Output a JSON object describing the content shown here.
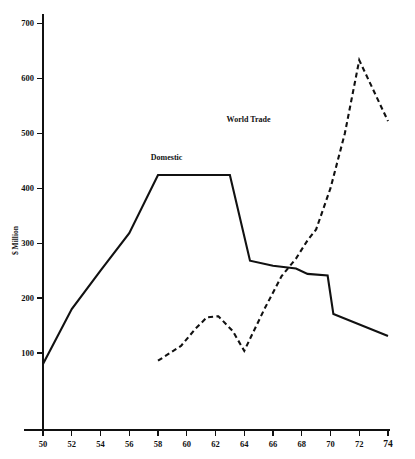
{
  "chart_data": {
    "type": "line",
    "title": "",
    "subtitle": "",
    "xlabel": "",
    "ylabel": "$ Million",
    "xlim": [
      50,
      74
    ],
    "ylim": [
      0,
      700
    ],
    "grid": false,
    "legend_position": "inline-annotation",
    "x_ticks": [
      "50",
      "52",
      "54",
      "56",
      "58",
      "60",
      "62",
      "64",
      "66",
      "68",
      "70",
      "72",
      "74"
    ],
    "x_tick_values": [
      50,
      52,
      54,
      56,
      58,
      60,
      62,
      64,
      66,
      68,
      70,
      72,
      74
    ],
    "y_ticks": [
      "100",
      "200",
      "300",
      "400",
      "500",
      "600",
      "700"
    ],
    "y_tick_values": [
      100,
      200,
      300,
      400,
      500,
      600,
      700
    ],
    "series": [
      {
        "name": "Domestic",
        "style": "solid",
        "color": "#111111",
        "label_x": 58.6,
        "label_y": 452,
        "points": [
          {
            "x": 50.0,
            "y": 80
          },
          {
            "x": 52.0,
            "y": 180
          },
          {
            "x": 54.0,
            "y": 250
          },
          {
            "x": 56.0,
            "y": 318
          },
          {
            "x": 58.0,
            "y": 424
          },
          {
            "x": 60.0,
            "y": 424
          },
          {
            "x": 62.0,
            "y": 424
          },
          {
            "x": 63.0,
            "y": 424
          },
          {
            "x": 64.4,
            "y": 268
          },
          {
            "x": 66.0,
            "y": 259
          },
          {
            "x": 67.6,
            "y": 254
          },
          {
            "x": 68.4,
            "y": 244
          },
          {
            "x": 69.8,
            "y": 241
          },
          {
            "x": 70.2,
            "y": 171
          },
          {
            "x": 74.0,
            "y": 131
          }
        ]
      },
      {
        "name": "World Trade",
        "style": "dashed",
        "color": "#111111",
        "label_x": 64.3,
        "label_y": 520,
        "points": [
          {
            "x": 58.0,
            "y": 86
          },
          {
            "x": 59.6,
            "y": 113
          },
          {
            "x": 60.6,
            "y": 144
          },
          {
            "x": 61.4,
            "y": 165
          },
          {
            "x": 62.2,
            "y": 167
          },
          {
            "x": 63.2,
            "y": 140
          },
          {
            "x": 64.0,
            "y": 104
          },
          {
            "x": 65.4,
            "y": 180
          },
          {
            "x": 66.6,
            "y": 240
          },
          {
            "x": 67.6,
            "y": 272
          },
          {
            "x": 68.4,
            "y": 305
          },
          {
            "x": 69.0,
            "y": 325
          },
          {
            "x": 70.0,
            "y": 400
          },
          {
            "x": 71.0,
            "y": 500
          },
          {
            "x": 72.0,
            "y": 633
          },
          {
            "x": 74.0,
            "y": 522
          }
        ]
      }
    ]
  },
  "annotations": {
    "domestic_label": "Domestic",
    "world_trade_label": "World Trade",
    "y_axis_title": "$ Million"
  }
}
